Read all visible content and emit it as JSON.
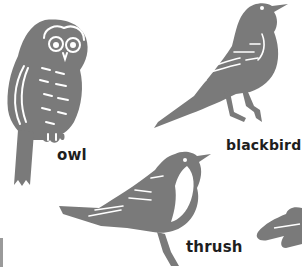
{
  "colors": {
    "background": "#ffffff",
    "silhouette": "#7a7a7a",
    "highlight": "#ffffff",
    "label": "#1e1e1e"
  },
  "birds": [
    {
      "id": "owl",
      "label": "owl",
      "icon": "owl-icon"
    },
    {
      "id": "blackbird",
      "label": "blackbird",
      "icon": "blackbird-icon"
    },
    {
      "id": "thrush",
      "label": "thrush",
      "icon": "thrush-icon"
    },
    {
      "id": "partial",
      "label": "",
      "icon": "partial-bird-icon"
    }
  ]
}
